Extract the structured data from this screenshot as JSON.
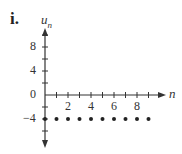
{
  "figure_label": "i.",
  "chart_data": {
    "type": "scatter",
    "title": "",
    "xlabel": "n",
    "ylabel": "u_n",
    "x": [
      1,
      2,
      3,
      4,
      5,
      6,
      7,
      8,
      9
    ],
    "series": [
      {
        "name": "u_n",
        "values": [
          -4,
          -4,
          -4,
          -4,
          -4,
          -4,
          -4,
          -4,
          -4
        ]
      }
    ],
    "x_ticks": [
      2,
      4,
      6,
      8
    ],
    "y_ticks": [
      8,
      4,
      0,
      -4
    ],
    "xlim": [
      0,
      10
    ],
    "ylim": [
      -6,
      10
    ],
    "grid": false,
    "legend": "none"
  },
  "axis_labels": {
    "x": "n",
    "y_main": "u",
    "y_sub": "n"
  },
  "tick_labels": {
    "x": [
      "2",
      "4",
      "6",
      "8"
    ],
    "y": [
      "8",
      "4",
      "0",
      "−4"
    ]
  }
}
